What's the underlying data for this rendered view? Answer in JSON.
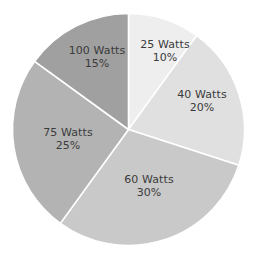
{
  "chart_data": {
    "type": "pie",
    "title": "",
    "subtitle": "",
    "xlabel": "",
    "ylabel": "",
    "legend_position": "none",
    "grid": false,
    "start_angle_deg": 0,
    "direction": "clockwise",
    "categories": [
      "25 Watts",
      "40 Watts",
      "60 Watts",
      "75 Watts",
      "100 Watts"
    ],
    "values": [
      10,
      20,
      30,
      25,
      15
    ],
    "value_unit": "%",
    "labels": [
      "25 Watts",
      "40 Watts",
      "60 Watts",
      "75 Watts",
      "100 Watts"
    ],
    "percent_labels": [
      "10%",
      "20%",
      "30%",
      "25%",
      "15%"
    ],
    "colors": [
      "#eeeeee",
      "#e0e0e0",
      "#c9c9c9",
      "#b3b3b3",
      "#a0a0a0"
    ],
    "slices": [
      {
        "name": "25 Watts",
        "percent": 10,
        "percent_label": "10%",
        "color": "#eeeeee",
        "start_deg": 0,
        "end_deg": 36
      },
      {
        "name": "40 Watts",
        "percent": 20,
        "percent_label": "20%",
        "color": "#e0e0e0",
        "start_deg": 36,
        "end_deg": 108
      },
      {
        "name": "60 Watts",
        "percent": 30,
        "percent_label": "30%",
        "color": "#c9c9c9",
        "start_deg": 108,
        "end_deg": 216
      },
      {
        "name": "75 Watts",
        "percent": 25,
        "percent_label": "25%",
        "color": "#b3b3b3",
        "start_deg": 216,
        "end_deg": 306
      },
      {
        "name": "100 Watts",
        "percent": 15,
        "percent_label": "15%",
        "color": "#a0a0a0",
        "start_deg": 306,
        "end_deg": 360
      }
    ],
    "separator_color": "#ffffff",
    "background_color": "#ffffff",
    "label_text_color": "#3b3b3b"
  }
}
